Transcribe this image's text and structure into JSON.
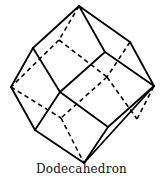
{
  "figure": {
    "caption": "Dodecahedron",
    "line_color": "#000000",
    "vertices": {
      "top": [
        79,
        6
      ],
      "upper_left": [
        33,
        48
      ],
      "upper_right": [
        130,
        42
      ],
      "center_upper": [
        105,
        52
      ],
      "left": [
        11,
        87
      ],
      "right": [
        154,
        86
      ],
      "center_left": [
        60,
        92
      ],
      "lower_left": [
        35,
        130
      ],
      "center_lower": [
        108,
        127
      ],
      "bottom": [
        84,
        163
      ],
      "hidden_upper": [
        59,
        40
      ],
      "hidden_center": [
        107,
        77
      ],
      "hidden_lower_left": [
        61,
        118
      ],
      "hidden_lower_right": [
        137,
        119
      ]
    },
    "visible_edges": [
      [
        "top",
        "upper_left"
      ],
      [
        "top",
        "center_upper"
      ],
      [
        "top",
        "upper_right"
      ],
      [
        "upper_left",
        "left"
      ],
      [
        "upper_left",
        "center_left"
      ],
      [
        "center_upper",
        "center_left"
      ],
      [
        "center_upper",
        "right"
      ],
      [
        "upper_right",
        "right"
      ],
      [
        "left",
        "lower_left"
      ],
      [
        "center_left",
        "lower_left"
      ],
      [
        "center_left",
        "center_lower"
      ],
      [
        "right",
        "center_lower"
      ],
      [
        "right",
        "bottom"
      ],
      [
        "lower_left",
        "bottom"
      ],
      [
        "center_lower",
        "bottom"
      ]
    ],
    "hidden_edges": [
      [
        "top",
        "hidden_upper"
      ],
      [
        "hidden_upper",
        "left"
      ],
      [
        "hidden_upper",
        "hidden_center"
      ],
      [
        "upper_right",
        "hidden_center"
      ],
      [
        "hidden_center",
        "hidden_lower_left"
      ],
      [
        "hidden_center",
        "hidden_lower_right"
      ],
      [
        "left",
        "hidden_lower_left"
      ],
      [
        "hidden_lower_left",
        "bottom"
      ],
      [
        "hidden_lower_right",
        "right"
      ]
    ]
  }
}
